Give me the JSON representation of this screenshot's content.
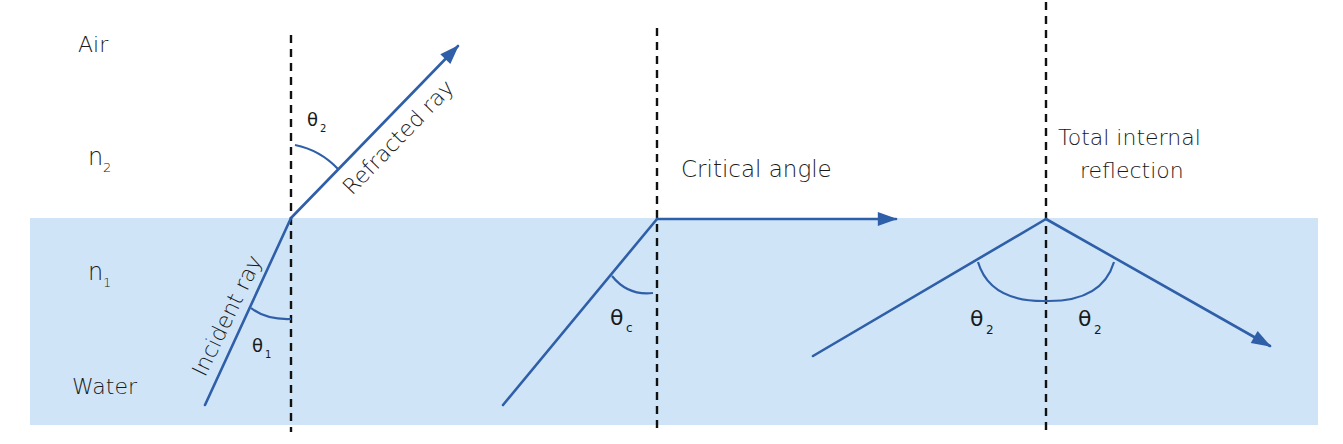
{
  "colors": {
    "water": "#cfe5f7",
    "ray": "#2f5fa8",
    "normal": "#111111",
    "text": "#1a1a1a"
  },
  "media_labels": {
    "air": "Air",
    "n2": "n",
    "n2_sub": "2",
    "n1": "n",
    "n1_sub": "1",
    "water": "Water"
  },
  "panels": [
    {
      "id": "refraction",
      "incident_label": "Incident ray",
      "refracted_label": "Refracted ray",
      "angle_incident": {
        "symbol": "θ",
        "sub": "1"
      },
      "angle_refracted": {
        "symbol": "θ",
        "sub": "2"
      }
    },
    {
      "id": "critical",
      "title": "Critical angle",
      "angle": {
        "symbol": "θ",
        "sub": "c"
      }
    },
    {
      "id": "tir",
      "title_line1": "Total internal",
      "title_line2": "reflection",
      "angle_left": {
        "symbol": "θ",
        "sub": "2"
      },
      "angle_right": {
        "symbol": "θ",
        "sub": "2"
      }
    }
  ]
}
